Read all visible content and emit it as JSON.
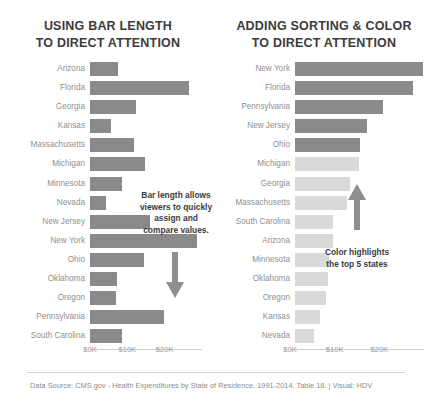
{
  "footer": {
    "source_text": "Data Source: CMS.gov - Health Expenditures by State of Residence, 1991-2014, Table 18.  |  Visual: HDV"
  },
  "colors": {
    "bar_dark": "#8a8a8a",
    "bar_muted": "#d9d9d9",
    "label": "#8f8f8f",
    "title": "#3b3b3b"
  },
  "panels": {
    "left": {
      "title": "USING BAR LENGTH\nTO DIRECT ATTENTION",
      "annotation": "Bar length allows viewers to quickly assign and compare values.",
      "arrow": "arrow-down"
    },
    "right": {
      "title": "ADDING SORTING & COLOR\nTO DIRECT ATTENTION",
      "annotation": "Color highlights the top 5 states",
      "arrow": "arrow-up"
    }
  },
  "chart_data": [
    {
      "type": "bar",
      "orientation": "horizontal",
      "title": "USING BAR LENGTH TO DIRECT ATTENTION",
      "xlabel": "",
      "ylabel": "",
      "xlim": [
        0,
        30000
      ],
      "ticks": [
        "$0K",
        "$10K",
        "$20K"
      ],
      "tick_values": [
        0,
        10000,
        20000
      ],
      "grid": false,
      "legend": "none",
      "sorted": "alphabetical",
      "categories": [
        "Arizona",
        "Florida",
        "Georgia",
        "Kansas",
        "Massachusetts",
        "Michigan",
        "Minnesota",
        "Nevada",
        "New Jersey",
        "New York",
        "Ohio",
        "Oklahoma",
        "Oregon",
        "Pennsylvania",
        "South Carolina"
      ],
      "values": [
        7600,
        26500,
        12400,
        5700,
        11700,
        14600,
        8600,
        4300,
        16100,
        28700,
        14400,
        7300,
        7000,
        19700,
        8500
      ],
      "colors": [
        "#8a8a8a",
        "#8a8a8a",
        "#8a8a8a",
        "#8a8a8a",
        "#8a8a8a",
        "#8a8a8a",
        "#8a8a8a",
        "#8a8a8a",
        "#8a8a8a",
        "#8a8a8a",
        "#8a8a8a",
        "#8a8a8a",
        "#8a8a8a",
        "#8a8a8a",
        "#8a8a8a"
      ]
    },
    {
      "type": "bar",
      "orientation": "horizontal",
      "title": "ADDING SORTING & COLOR TO DIRECT ATTENTION",
      "xlabel": "",
      "ylabel": "",
      "xlim": [
        0,
        30000
      ],
      "ticks": [
        "$0K",
        "$10K",
        "$20K"
      ],
      "tick_values": [
        0,
        10000,
        20000
      ],
      "grid": false,
      "legend": "none",
      "sorted": "descending",
      "categories": [
        "New York",
        "Florida",
        "Pennsylvania",
        "New Jersey",
        "Ohio",
        "Michigan",
        "Georgia",
        "Massachusetts",
        "South Carolina",
        "Arizona",
        "Minnesota",
        "Oklahoma",
        "Oregon",
        "Kansas",
        "Nevada"
      ],
      "values": [
        28700,
        26500,
        19700,
        16100,
        14600,
        14400,
        12400,
        11700,
        8600,
        8500,
        7600,
        7300,
        7000,
        5700,
        4300
      ],
      "colors": [
        "#8a8a8a",
        "#8a8a8a",
        "#8a8a8a",
        "#8a8a8a",
        "#8a8a8a",
        "#d9d9d9",
        "#d9d9d9",
        "#d9d9d9",
        "#d9d9d9",
        "#d9d9d9",
        "#d9d9d9",
        "#d9d9d9",
        "#d9d9d9",
        "#d9d9d9",
        "#d9d9d9"
      ]
    }
  ]
}
